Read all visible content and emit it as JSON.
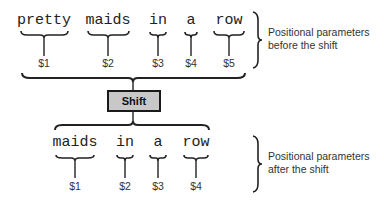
{
  "before": {
    "words": [
      {
        "text": "pretty",
        "param": "$1"
      },
      {
        "text": "maids",
        "param": "$2"
      },
      {
        "text": "in",
        "param": "$3"
      },
      {
        "text": "a",
        "param": "$4"
      },
      {
        "text": "row",
        "param": "$5"
      }
    ],
    "caption_line1": "Positional parameters",
    "caption_line2": "before the shift"
  },
  "shift": {
    "label": "Shift",
    "fill": "#c8c8c8",
    "border": "#1a1a1a"
  },
  "after": {
    "words": [
      {
        "text": "maids",
        "param": "$1"
      },
      {
        "text": "in",
        "param": "$2"
      },
      {
        "text": "a",
        "param": "$3"
      },
      {
        "text": "row",
        "param": "$4"
      }
    ],
    "caption_line1": "Positional parameters",
    "caption_line2": "after the shift"
  }
}
